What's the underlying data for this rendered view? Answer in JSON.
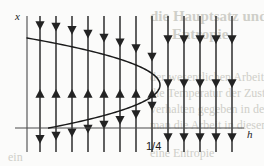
{
  "figure": {
    "kind": "phase-line-bifurcation-diagram",
    "axis_label_vertical": "x",
    "axis_label_horizontal": "h",
    "tick_label_vertex": "1/4",
    "colors": {
      "curve": "#1a1a1a",
      "field_line": "#3a3a3a",
      "axis": "#4a4a4a",
      "background": "#fbfbfa",
      "ghost_text": "#cfcfc9"
    },
    "ghost_text": {
      "line_1": "die Hauptsatz und \"empirie",
      "line_2": "Entropie",
      "line_3": "der wesentlichen Arbeit an",
      "line_4": "die Temperatur der Zustand",
      "line_5": "verhalten gegeben in dem",
      "line_6": "man die Arbeit in diesem Fall",
      "line_7": "eine Entropie",
      "line_8": "ein"
    }
  },
  "chart_data": {
    "type": "line",
    "title": "",
    "xlabel": "h",
    "ylabel": "x",
    "grid": false,
    "legend": null,
    "axes": {
      "origin_px": {
        "x": 27,
        "y": 128
      },
      "x_axis_end_px": 244,
      "y_axis_top_px": 16,
      "y_axis_bottom_px": 152
    },
    "annotations": [
      {
        "text": "1/4",
        "at_px": {
          "x": 146,
          "y": 140
        },
        "describes": "h value of parabola vertex"
      },
      {
        "text": "x",
        "at_px": {
          "x": 15,
          "y": 10
        },
        "describes": "vertical axis label"
      },
      {
        "text": "h",
        "at_px": {
          "x": 247,
          "y": 128
        },
        "describes": "horizontal axis label"
      }
    ],
    "series": [
      {
        "name": "fixed-point parabola (sideways, opens left)",
        "kind": "curve",
        "vertex_px": {
          "x": 160,
          "y": 85
        },
        "points_px": [
          {
            "x": 27,
            "y": 38
          },
          {
            "x": 55,
            "y": 45
          },
          {
            "x": 85,
            "y": 54
          },
          {
            "x": 110,
            "y": 62
          },
          {
            "x": 132,
            "y": 70
          },
          {
            "x": 148,
            "y": 77
          },
          {
            "x": 158,
            "y": 84
          },
          {
            "x": 160,
            "y": 88
          },
          {
            "x": 154,
            "y": 96
          },
          {
            "x": 142,
            "y": 104
          },
          {
            "x": 124,
            "y": 111
          },
          {
            "x": 100,
            "y": 117
          },
          {
            "x": 72,
            "y": 123
          },
          {
            "x": 45,
            "y": 126
          },
          {
            "x": 27,
            "y": 128
          }
        ]
      }
    ],
    "vector_field": {
      "kind": "vertical-flow-lines-with-arrowheads",
      "line_x_px": [
        40,
        56,
        72,
        88,
        104,
        120,
        136,
        152,
        168,
        184,
        200,
        216,
        232
      ],
      "line_top_px": 16,
      "line_bottom_px": 152,
      "arrow_segments": [
        {
          "region": "above upper branch of parabola",
          "direction": "down"
        },
        {
          "region": "between branches (inside parabola)",
          "direction": "up"
        },
        {
          "region": "below lower branch of parabola",
          "direction": "down"
        },
        {
          "region": "right of vertex (h > 1/4)",
          "direction": "down"
        }
      ]
    }
  }
}
